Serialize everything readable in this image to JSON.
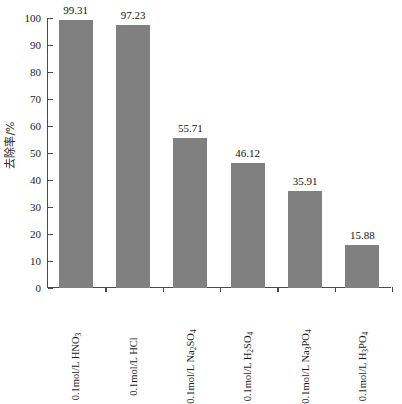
{
  "chart_data": {
    "type": "bar",
    "title": "",
    "subtitle": "",
    "xlabel": "",
    "ylabel": "去除率/%",
    "ylim": [
      0,
      100
    ],
    "ytick_step": 10,
    "yticks": [
      0,
      10,
      20,
      30,
      40,
      50,
      60,
      70,
      80,
      90,
      100
    ],
    "grid": false,
    "legend": null,
    "bar_color": "#808080",
    "axis_color": "#4a4a4a",
    "categories": [
      "0.1mol/L HNO3",
      "0.1mol/L HCl",
      "0.1mol/L Na2SO4",
      "0.1mol/L H2SO4",
      "0.1mol/L Na3PO4",
      "0.1mol/L H3PO4"
    ],
    "categories_rich": [
      {
        "prefix": "0.1mol/L HNO",
        "sub": "3",
        "suffix": ""
      },
      {
        "prefix": "0.1mol/L HCl",
        "sub": "",
        "suffix": ""
      },
      {
        "prefix": "0.1mol/L Na",
        "sub": "2",
        "suffix": "SO",
        "sub2": "4"
      },
      {
        "prefix": "0.1mol/L H",
        "sub": "2",
        "suffix": "SO",
        "sub2": "4"
      },
      {
        "prefix": "0.1mol/L Na",
        "sub": "3",
        "suffix": "PO",
        "sub2": "4"
      },
      {
        "prefix": "0.1mol/L H",
        "sub": "3",
        "suffix": "PO",
        "sub2": "4"
      }
    ],
    "values": [
      99.31,
      97.23,
      55.71,
      46.12,
      35.91,
      15.88
    ],
    "value_labels": [
      "99.31",
      "97.23",
      "55.71",
      "46.12",
      "35.91",
      "15.88"
    ]
  }
}
